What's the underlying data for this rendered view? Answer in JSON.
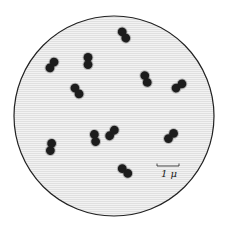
{
  "figure": {
    "field": {
      "cx": 114,
      "cy": 116,
      "r": 100,
      "fill": "#ececec",
      "stroke": "#222222"
    },
    "cell_color": "#1c1c1c",
    "halo_color": "#8a8a8a",
    "scale_bar": {
      "label": "1 μ",
      "x1": 157,
      "x2": 179,
      "y": 166
    },
    "diplococci": [
      {
        "x": 124,
        "y": 35,
        "angle": 60
      },
      {
        "x": 52,
        "y": 65,
        "angle": -55
      },
      {
        "x": 88,
        "y": 61,
        "angle": 90
      },
      {
        "x": 77,
        "y": 91,
        "angle": 55
      },
      {
        "x": 146,
        "y": 79,
        "angle": 70
      },
      {
        "x": 179,
        "y": 86,
        "angle": -35
      },
      {
        "x": 51,
        "y": 147,
        "angle": -80
      },
      {
        "x": 95,
        "y": 138,
        "angle": 80
      },
      {
        "x": 112,
        "y": 133,
        "angle": -50
      },
      {
        "x": 171,
        "y": 136,
        "angle": -45
      },
      {
        "x": 125,
        "y": 171,
        "angle": 40
      }
    ]
  }
}
